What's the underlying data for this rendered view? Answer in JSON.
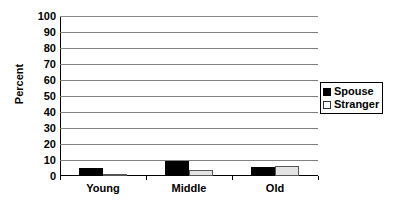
{
  "chart_data": {
    "type": "bar",
    "title": "",
    "xlabel": "",
    "ylabel": "Percent",
    "categories": [
      "Young",
      "Middle",
      "Old"
    ],
    "series": [
      {
        "name": "Spouse",
        "color": "#000000",
        "values": [
          5,
          9.5,
          5.5
        ]
      },
      {
        "name": "Stranger",
        "color": "#e3e3e3",
        "values": [
          1.5,
          4,
          6
        ]
      }
    ],
    "ylim": [
      0,
      100
    ],
    "yticks": [
      100,
      90,
      80,
      70,
      60,
      50,
      40,
      30,
      20,
      10,
      0
    ],
    "ytick_labels": [
      "100",
      "90",
      "80",
      "70",
      "60",
      "50",
      "40",
      "30",
      "20",
      "10",
      "0"
    ],
    "grid": true,
    "grid_axis": "y",
    "legend": [
      "Spouse",
      "Stranger"
    ],
    "legend_position": "right"
  },
  "legend": {
    "entries": [
      {
        "label": "Spouse"
      },
      {
        "label": "Stranger"
      }
    ]
  }
}
